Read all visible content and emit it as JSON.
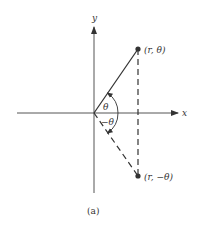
{
  "diagram": {
    "caption": "(a)",
    "axes": {
      "x_label": "x",
      "y_label": "y"
    },
    "points": [
      {
        "label": "(r, θ)",
        "x": 138,
        "y": 49
      },
      {
        "label": "(r, −θ)",
        "x": 138,
        "y": 176
      }
    ],
    "angles": {
      "upper": "θ",
      "lower": "−θ"
    },
    "colors": {
      "ink": "#333333",
      "background": "#ffffff"
    }
  }
}
